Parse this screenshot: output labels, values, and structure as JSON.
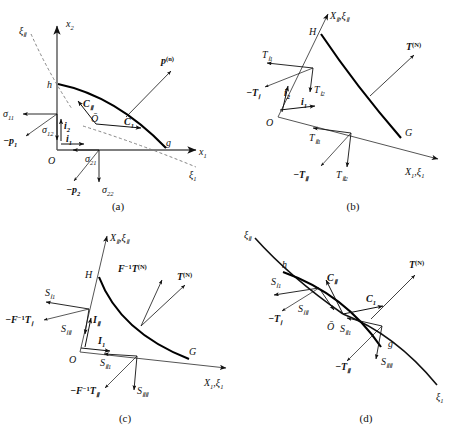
{
  "figure": {
    "type": "technical-diagram",
    "panel_captions": [
      "(a)",
      "(b)",
      "(c)",
      "(d)"
    ],
    "background_color": "#ffffff",
    "line_color": "#111111",
    "curve_color": "#000000"
  },
  "panel_a": {
    "caption": "(a)",
    "axes": [
      {
        "name": "axis-x2",
        "label": "x",
        "subscript": "2"
      },
      {
        "name": "axis-x1",
        "label": "x",
        "subscript": "1"
      }
    ],
    "curvilinear_axes": [
      {
        "name": "axis-xi2",
        "label": "ξ",
        "subscript": "Ⅱ"
      },
      {
        "name": "axis-xi1",
        "label": "ξ",
        "subscript": "1"
      }
    ],
    "points": [
      {
        "name": "point-O",
        "label": "O"
      },
      {
        "name": "point-h",
        "label": "h"
      },
      {
        "name": "point-g",
        "label": "g"
      },
      {
        "name": "point-Obar",
        "label": "Ō"
      }
    ],
    "base_vectors": [
      {
        "name": "vector-i1",
        "label": "i",
        "subscript": "1"
      },
      {
        "name": "vector-i2",
        "label": "i",
        "subscript": "2"
      },
      {
        "name": "vector-C1",
        "label": "C",
        "subscript": "1"
      },
      {
        "name": "vector-C2",
        "label": "C",
        "subscript": "Ⅱ"
      }
    ],
    "stress_labels": [
      {
        "name": "stress-sigma11",
        "label": "σ",
        "subscript": "11"
      },
      {
        "name": "stress-sigma12",
        "label": "σ",
        "subscript": "12"
      },
      {
        "name": "stress-sigma21",
        "label": "σ",
        "subscript": "21"
      },
      {
        "name": "stress-sigma22",
        "label": "σ",
        "subscript": "22"
      }
    ],
    "traction_labels": [
      {
        "name": "traction-minus-p1",
        "label": "−p",
        "subscript": "1"
      },
      {
        "name": "traction-minus-p2",
        "label": "−p",
        "subscript": "2"
      },
      {
        "name": "traction-p-n",
        "label": "p",
        "superscript": "(n)"
      }
    ]
  },
  "panel_b": {
    "caption": "(b)",
    "axes": [
      {
        "name": "axis-X2-xi2",
        "label": "X",
        "subscript": "Ⅱ",
        "label2": ",ξ",
        "subscript2": "Ⅱ"
      },
      {
        "name": "axis-X1-xi1",
        "label": "X",
        "subscript": "1",
        "label2": ",ξ",
        "subscript2": "1"
      }
    ],
    "points": [
      {
        "name": "point-O",
        "label": "O"
      },
      {
        "name": "point-H",
        "label": "H"
      },
      {
        "name": "point-G",
        "label": "G"
      }
    ],
    "base_vectors": [
      {
        "name": "vector-i1",
        "label": "i",
        "subscript": "1"
      },
      {
        "name": "vector-i2",
        "label": "i",
        "subscript": "2"
      }
    ],
    "traction_components": [
      {
        "name": "traction-T-I1",
        "label": "T",
        "subscript": "Ⅰ1"
      },
      {
        "name": "traction-T-I2",
        "label": "T",
        "subscript": "Ⅰ2"
      },
      {
        "name": "traction-T-II1",
        "label": "T",
        "subscript": "Ⅱ1"
      },
      {
        "name": "traction-T-II2",
        "label": "T",
        "subscript": "Ⅱ2"
      }
    ],
    "traction_vectors": [
      {
        "name": "traction-minus-T-I",
        "label": "−T",
        "subscript": "Ⅰ"
      },
      {
        "name": "traction-minus-T-II",
        "label": "−T",
        "subscript": "Ⅱ"
      },
      {
        "name": "traction-T-N",
        "label": "T",
        "superscript": "(N)"
      }
    ]
  },
  "panel_c": {
    "caption": "(c)",
    "axes": [
      {
        "name": "axis-X2-xi2",
        "label": "X",
        "subscript": "Ⅱ",
        "label2": ",ξ",
        "subscript2": "Ⅱ"
      },
      {
        "name": "axis-X1-xi1",
        "label": "X",
        "subscript": "1",
        "label2": ",ξ",
        "subscript2": "1"
      }
    ],
    "points": [
      {
        "name": "point-O",
        "label": "O"
      },
      {
        "name": "point-H",
        "label": "H"
      },
      {
        "name": "point-G",
        "label": "G"
      }
    ],
    "base_vectors": [
      {
        "name": "vector-I1",
        "label": "I",
        "subscript": "1"
      },
      {
        "name": "vector-I2",
        "label": "I",
        "subscript": "Ⅱ"
      }
    ],
    "stress_components": [
      {
        "name": "stress-S-I1",
        "label": "S",
        "subscript": "Ⅰ1"
      },
      {
        "name": "stress-S-I2",
        "label": "S",
        "subscript": "ⅠⅡ"
      },
      {
        "name": "stress-S-II1",
        "label": "S",
        "subscript": "Ⅱ1"
      },
      {
        "name": "stress-S-II2",
        "label": "S",
        "subscript": "ⅡⅡ"
      }
    ],
    "traction_vectors": [
      {
        "name": "traction-minus-Finv-T-I",
        "label": "−F",
        "superscript": "−1",
        "label2": "T",
        "subscript2": "Ⅰ"
      },
      {
        "name": "traction-minus-Finv-T-II",
        "label": "−F",
        "superscript": "−1",
        "label2": "T",
        "subscript2": "Ⅱ"
      },
      {
        "name": "traction-Finv-T-N",
        "label": "F",
        "superscript": "−1",
        "label2": "T",
        "superscript2": "(N)"
      },
      {
        "name": "traction-T-N",
        "label": "T",
        "superscript": "(N)"
      }
    ]
  },
  "panel_d": {
    "caption": "(d)",
    "curvilinear_axes": [
      {
        "name": "axis-xi2",
        "label": "ξ",
        "subscript": "Ⅱ"
      },
      {
        "name": "axis-xi1",
        "label": "ξ",
        "subscript": "1"
      }
    ],
    "points": [
      {
        "name": "point-h",
        "label": "h"
      },
      {
        "name": "point-g",
        "label": "g"
      },
      {
        "name": "point-Obar",
        "label": "Ō"
      }
    ],
    "base_vectors": [
      {
        "name": "vector-C1",
        "label": "C",
        "subscript": "1"
      },
      {
        "name": "vector-C2",
        "label": "C",
        "subscript": "Ⅱ"
      }
    ],
    "stress_components": [
      {
        "name": "stress-S-I1",
        "label": "S",
        "subscript": "Ⅰ1"
      },
      {
        "name": "stress-S-I2",
        "label": "S",
        "subscript": "ⅠⅡ"
      },
      {
        "name": "stress-S-II1",
        "label": "S",
        "subscript": "Ⅱ1"
      },
      {
        "name": "stress-S-II2",
        "label": "S",
        "subscript": "ⅡⅡ"
      }
    ],
    "traction_vectors": [
      {
        "name": "traction-minus-T-I",
        "label": "−T",
        "subscript": "Ⅰ"
      },
      {
        "name": "traction-minus-T-II",
        "label": "−T",
        "subscript": "Ⅱ"
      },
      {
        "name": "traction-T-N",
        "label": "T",
        "superscript": "(N)"
      }
    ]
  }
}
